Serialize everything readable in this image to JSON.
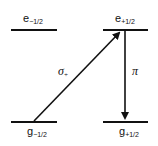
{
  "diagram": {
    "type": "energy-level-diagram",
    "levels": [
      {
        "id": "e_minus",
        "base": "e",
        "sub": "−1/2",
        "position": "top-left"
      },
      {
        "id": "e_plus",
        "base": "e",
        "sub": "+1/2",
        "position": "top-right"
      },
      {
        "id": "g_minus",
        "base": "g",
        "sub": "−1/2",
        "position": "bottom-left"
      },
      {
        "id": "g_plus",
        "base": "g",
        "sub": "+1/2",
        "position": "bottom-right"
      }
    ],
    "transitions": [
      {
        "id": "sigma",
        "label_base": "σ",
        "label_sub": "+",
        "from": "g_minus",
        "to": "e_plus"
      },
      {
        "id": "pi",
        "label_base": "π",
        "label_sub": "",
        "from": "e_plus",
        "to": "g_plus"
      }
    ],
    "line_color": "#111111"
  }
}
